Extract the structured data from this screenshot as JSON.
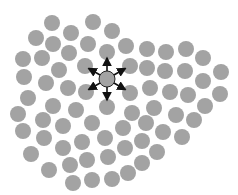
{
  "diagram": {
    "particle_color": "#a3a3a3",
    "arrow_color": "#111111",
    "particle_radius": 8,
    "center": {
      "x": 107,
      "y": 79,
      "arrow_length": 21,
      "arrow_angles_deg": [
        -90,
        -30,
        30,
        90,
        150,
        210
      ]
    },
    "particles": [
      [
        52,
        23
      ],
      [
        93,
        22
      ],
      [
        112,
        31
      ],
      [
        36,
        38
      ],
      [
        71,
        33
      ],
      [
        53,
        44
      ],
      [
        88,
        44
      ],
      [
        126,
        46
      ],
      [
        147,
        49
      ],
      [
        166,
        52
      ],
      [
        186,
        49
      ],
      [
        203,
        58
      ],
      [
        23,
        59
      ],
      [
        42,
        58
      ],
      [
        69,
        53
      ],
      [
        107,
        52
      ],
      [
        85,
        66
      ],
      [
        130,
        66
      ],
      [
        147,
        68
      ],
      [
        165,
        71
      ],
      [
        185,
        71
      ],
      [
        203,
        81
      ],
      [
        221,
        72
      ],
      [
        24,
        77
      ],
      [
        59,
        70
      ],
      [
        46,
        83
      ],
      [
        68,
        88
      ],
      [
        86,
        92
      ],
      [
        130,
        93
      ],
      [
        150,
        88
      ],
      [
        170,
        92
      ],
      [
        188,
        95
      ],
      [
        220,
        94
      ],
      [
        205,
        106
      ],
      [
        28,
        98
      ],
      [
        53,
        106
      ],
      [
        76,
        110
      ],
      [
        107,
        107
      ],
      [
        132,
        113
      ],
      [
        154,
        108
      ],
      [
        176,
        115
      ],
      [
        194,
        120
      ],
      [
        18,
        114
      ],
      [
        43,
        120
      ],
      [
        63,
        126
      ],
      [
        92,
        123
      ],
      [
        123,
        128
      ],
      [
        146,
        123
      ],
      [
        163,
        132
      ],
      [
        182,
        137
      ],
      [
        23,
        131
      ],
      [
        44,
        138
      ],
      [
        82,
        142
      ],
      [
        105,
        138
      ],
      [
        142,
        141
      ],
      [
        157,
        152
      ],
      [
        31,
        154
      ],
      [
        63,
        148
      ],
      [
        87,
        160
      ],
      [
        108,
        157
      ],
      [
        125,
        148
      ],
      [
        142,
        163
      ],
      [
        49,
        170
      ],
      [
        70,
        165
      ],
      [
        73,
        183
      ],
      [
        92,
        180
      ],
      [
        112,
        179
      ],
      [
        128,
        173
      ]
    ]
  }
}
